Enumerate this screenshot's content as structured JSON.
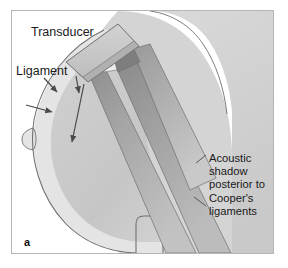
{
  "figure": {
    "panel_letter": "a",
    "type": "medical-illustration"
  },
  "labels": {
    "transducer": "Transducer",
    "ligament": "Ligament",
    "acoustic_shadow": "Acoustic\nshadow\nposterior to\nCooper's\nligaments"
  },
  "colors": {
    "background": "#ffffff",
    "frame_border": "#b5b5b5",
    "outline": "#6f6f6f",
    "skin_light": "#e2e2e2",
    "breast_tissue": "#c8c8c8",
    "tissue_deep": "#d6d6d6",
    "shadow_dark": "#8a8a8a",
    "shadow_mid": "#a6a6a6",
    "shadow_light": "#bdbdbd",
    "transducer_fill": "#c6c6c6",
    "wedge_dark": "#7e7e7e",
    "text": "#1a1a1a",
    "arrow": "#4a4a4a"
  },
  "annotations": {
    "ligament_arrow_count": 3,
    "shadow_leader_count": 2,
    "tissue_arrow_count": 1
  }
}
